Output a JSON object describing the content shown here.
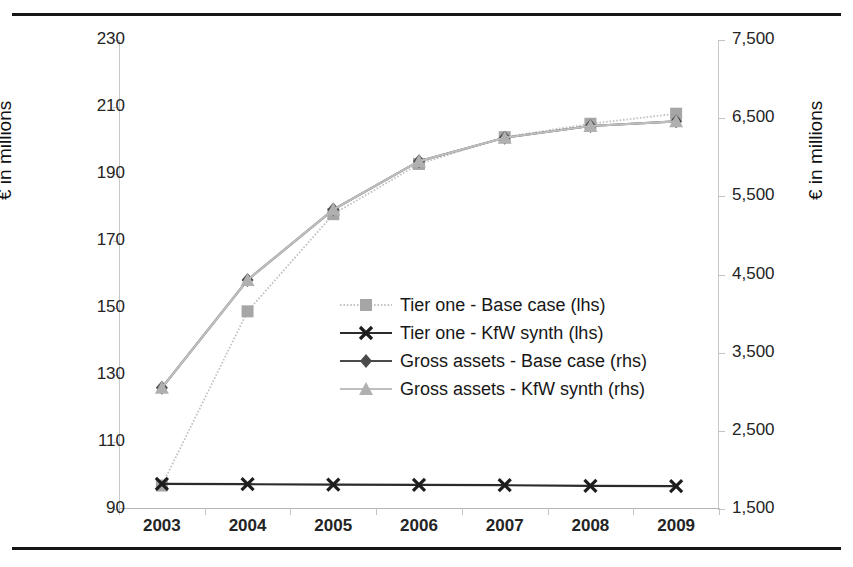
{
  "figure": {
    "top_fragment": "",
    "background": "#ffffff",
    "rule_color": "#161616"
  },
  "axes": {
    "left_title": "€ in millions",
    "right_title": "€ in millions",
    "left_ticks": [
      "230",
      "210",
      "190",
      "170",
      "150",
      "130",
      "110",
      "90"
    ],
    "right_ticks": [
      "7,500",
      "6,500",
      "5,500",
      "4,500",
      "3,500",
      "2,500",
      "1,500"
    ],
    "x_ticks": [
      "2003",
      "2004",
      "2005",
      "2006",
      "2007",
      "2008",
      "2009"
    ]
  },
  "legend": {
    "position": "center",
    "items": [
      {
        "label": "Tier one - Base case (lhs)",
        "marker": "square",
        "color": "#a6a6a6",
        "line_color": "#c2c2c2",
        "line_style": "dotted"
      },
      {
        "label": "Tier one - KfW synth (lhs)",
        "marker": "x",
        "color": "#1d1d1d",
        "line_color": "#2b2b2b",
        "line_style": "solid"
      },
      {
        "label": "Gross assets - Base case (rhs)",
        "marker": "diamond",
        "color": "#4a4a4a",
        "line_color": "#4a4a4a",
        "line_style": "solid"
      },
      {
        "label": "Gross assets - KfW synth (rhs)",
        "marker": "triangle",
        "color": "#b0b0b0",
        "line_color": "#bfbfbf",
        "line_style": "solid"
      }
    ]
  },
  "chart_data": {
    "type": "line",
    "title": "",
    "xlabel": "",
    "ylabel": "€ in millions",
    "y2label": "€ in millions",
    "x": [
      "2003",
      "2004",
      "2005",
      "2006",
      "2007",
      "2008",
      "2009"
    ],
    "ylim": [
      90,
      230
    ],
    "ytick_step": 20,
    "y2lim": [
      1500,
      7500
    ],
    "y2tick_step": 1000,
    "grid": false,
    "series": [
      {
        "name": "Tier one - Base case (lhs)",
        "axis": "left",
        "marker": "square",
        "color": "#a6a6a6",
        "line_color": "#c2c2c2",
        "line_style": "dotted",
        "values": [
          97,
          149,
          178,
          193,
          201,
          205,
          208
        ]
      },
      {
        "name": "Tier one - KfW synth (lhs)",
        "axis": "left",
        "marker": "x",
        "color": "#1d1d1d",
        "line_color": "#2b2b2b",
        "line_style": "solid",
        "values": [
          97.5,
          97.4,
          97.3,
          97.2,
          97.1,
          96.9,
          96.8
        ]
      },
      {
        "name": "Gross assets - Base case (rhs)",
        "axis": "right",
        "marker": "diamond",
        "color": "#4a4a4a",
        "line_color": "#4a4a4a",
        "line_style": "solid",
        "values": [
          3050,
          4430,
          5330,
          5950,
          6250,
          6400,
          6460
        ]
      },
      {
        "name": "Gross assets - KfW synth (rhs)",
        "axis": "right",
        "marker": "triangle",
        "color": "#b0b0b0",
        "line_color": "#bfbfbf",
        "line_style": "solid",
        "values": [
          3050,
          4430,
          5330,
          5950,
          6250,
          6400,
          6460
        ]
      }
    ]
  }
}
